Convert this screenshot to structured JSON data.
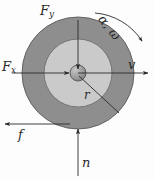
{
  "figure": {
    "kind": "free-body-diagram",
    "background_color": "#fdfdfd",
    "line_color": "#2b2b2b",
    "geometry": {
      "center_x": 78,
      "center_y": 73,
      "outer_radius": 56,
      "inner_radius": 34,
      "hub_radius": 8
    },
    "colors": {
      "outer_ring": "#8e8e8e",
      "inner_disc": "#cacaca",
      "hub": "#9a9a9a",
      "outline": "#4a4a4a"
    }
  },
  "labels": {
    "force_y": {
      "base": "F",
      "sub": "y",
      "text": "Fy"
    },
    "force_x": {
      "base": "F",
      "sub": "x",
      "text": "Fx"
    },
    "velocity": {
      "text": "v"
    },
    "radius": {
      "text": "r"
    },
    "friction": {
      "text": "f"
    },
    "normal": {
      "text": "n"
    },
    "angular": {
      "text": "α, ω"
    }
  },
  "arrows": [
    {
      "name": "force-y-arrow",
      "label": "Fy",
      "direction": "down",
      "from": [
        78,
        22
      ],
      "to": [
        78,
        70
      ]
    },
    {
      "name": "force-x-arrow",
      "label": "Fx",
      "direction": "right",
      "from": [
        14,
        73
      ],
      "to": [
        70,
        73
      ]
    },
    {
      "name": "velocity-arrow",
      "label": "v",
      "direction": "right",
      "from": [
        78,
        73
      ],
      "to": [
        148,
        73
      ]
    },
    {
      "name": "friction-arrow",
      "label": "f",
      "direction": "left",
      "from": [
        70,
        124
      ],
      "to": [
        6,
        124
      ]
    },
    {
      "name": "normal-arrow",
      "label": "n",
      "direction": "up",
      "from": [
        78,
        174
      ],
      "to": [
        78,
        128
      ]
    },
    {
      "name": "angular-arc",
      "label": "α, ω",
      "direction": "clockwise-arc",
      "from": [
        95,
        12
      ],
      "to": [
        143,
        42
      ]
    },
    {
      "name": "radius-line",
      "label": "r",
      "direction": "none",
      "from": [
        78,
        73
      ],
      "to": [
        118,
        112
      ]
    }
  ]
}
